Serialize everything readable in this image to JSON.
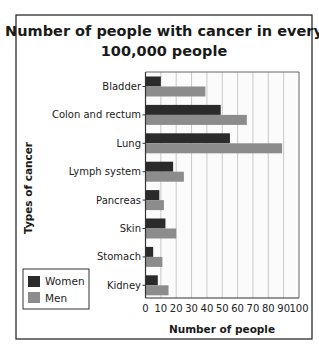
{
  "chart_data": {
    "type": "bar",
    "orientation": "horizontal",
    "title": "Number of people with cancer in every 100,000 people",
    "title_lines": [
      "Number of people with cancer in every",
      "100,000 people"
    ],
    "xlabel": "Number of people",
    "ylabel": "Types of cancer",
    "categories": [
      "Bladder",
      "Colon and rectum",
      "Lung",
      "Lymph system",
      "Pancreas",
      "Skin",
      "Stomach",
      "Kidney"
    ],
    "series": [
      {
        "name": "Women",
        "color": "#2b2b2b",
        "values": [
          10,
          49,
          55,
          18,
          9,
          13,
          5,
          8
        ]
      },
      {
        "name": "Men",
        "color": "#8c8c8c",
        "values": [
          39,
          66,
          89,
          25,
          12,
          20,
          11,
          15
        ]
      }
    ],
    "xlim": [
      0,
      100
    ],
    "xticks": [
      "0",
      "10",
      "20",
      "30",
      "40",
      "50",
      "60",
      "70",
      "80",
      "90",
      "100"
    ],
    "grid": true,
    "legend_position": "lower-left"
  }
}
